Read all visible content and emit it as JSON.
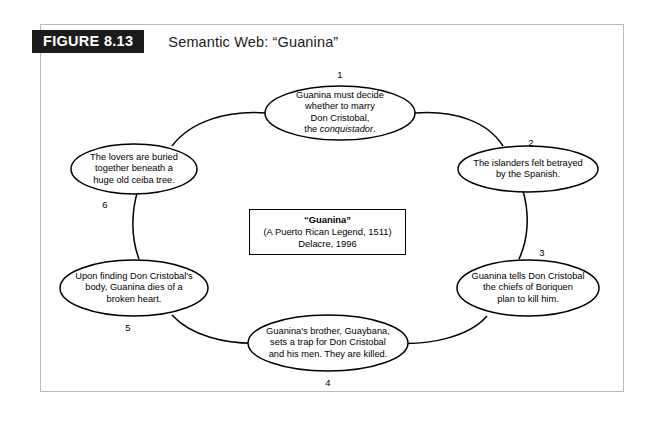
{
  "figure": {
    "tag": "FIGURE 8.13",
    "title": "Semantic Web: “Guanina”"
  },
  "center": {
    "title": "“Guanina”",
    "line2": "(A Puerto Rican Legend, 1511)",
    "line3": "Delacre, 1996"
  },
  "nodes": [
    {
      "number": "1",
      "lines": [
        "Guanina must decide",
        "whether to marry",
        "Don Cristobal,",
        "the conquistador."
      ],
      "italic_word": "conquistador"
    },
    {
      "number": "2",
      "lines": [
        "The islanders felt betrayed",
        "by the Spanish."
      ]
    },
    {
      "number": "3",
      "lines": [
        "Guanina tells Don Cristobal",
        "the chiefs of Boriquen",
        "plan to kill him."
      ]
    },
    {
      "number": "4",
      "lines": [
        "Guanina's brother, Guaybana,",
        "sets a trap for Don Cristobal",
        "and his men. They are killed."
      ]
    },
    {
      "number": "5",
      "lines": [
        "Upon finding Don Cristobal's",
        "body, Guanina dies of a",
        "broken heart."
      ]
    },
    {
      "number": "6",
      "lines": [
        "The lovers are buried",
        "together beneath a",
        "huge old ceiba tree."
      ]
    }
  ],
  "colors": {
    "tag_background": "#1b1b1b",
    "tag_text": "#ffffff",
    "frame_border": "#b9b9bb",
    "stroke": "#000000",
    "background": "#ffffff"
  }
}
